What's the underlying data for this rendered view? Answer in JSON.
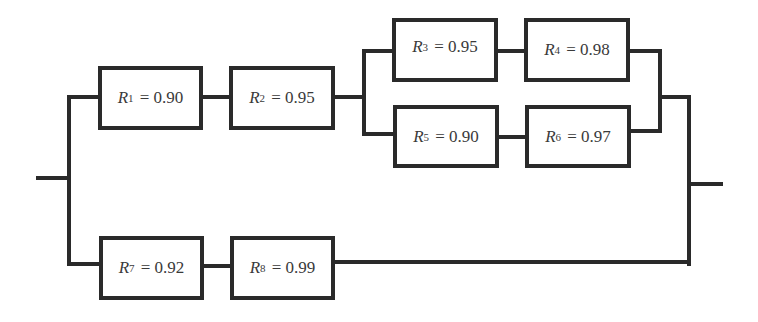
{
  "diagram": {
    "type": "reliability-block-diagram",
    "stroke_color": "#2a2a2a",
    "components": [
      {
        "id": "R1",
        "symbol": "R",
        "sub": "1",
        "eq": " = 0.90",
        "value": 0.9
      },
      {
        "id": "R2",
        "symbol": "R",
        "sub": "2",
        "eq": " = 0.95",
        "value": 0.95
      },
      {
        "id": "R3",
        "symbol": "R",
        "sub": "3",
        "eq": " = 0.95",
        "value": 0.95
      },
      {
        "id": "R4",
        "symbol": "R",
        "sub": "4",
        "eq": " = 0.98",
        "value": 0.98
      },
      {
        "id": "R5",
        "symbol": "R",
        "sub": "5",
        "eq": " = 0.90",
        "value": 0.9
      },
      {
        "id": "R6",
        "symbol": "R",
        "sub": "6",
        "eq": " = 0.97",
        "value": 0.97
      },
      {
        "id": "R7",
        "symbol": "R",
        "sub": "7",
        "eq": " = 0.92",
        "value": 0.92
      },
      {
        "id": "R8",
        "symbol": "R",
        "sub": "8",
        "eq": " = 0.99",
        "value": 0.99
      }
    ],
    "structure": "parallel( series(R1, R2, parallel(series(R3,R4), series(R5,R6))), series(R7, R8) )"
  }
}
